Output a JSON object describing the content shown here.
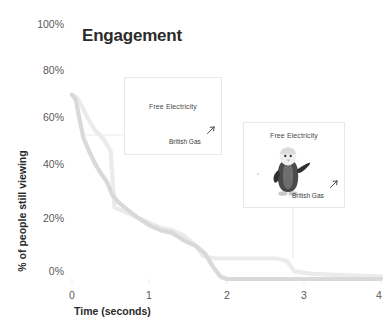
{
  "chart_data": {
    "type": "line",
    "title": "Engagement",
    "xlabel": "Time (seconds)",
    "ylabel": "% of people still viewing",
    "xlim": [
      0,
      4
    ],
    "ylim": [
      0,
      100
    ],
    "xticks": [
      "0",
      "1",
      "2",
      "3",
      "4"
    ],
    "xtick_values": [
      0,
      1,
      2,
      3,
      4
    ],
    "yticks": [
      "0%",
      "20%",
      "40%",
      "60%",
      "80%",
      "100%"
    ],
    "ytick_values": [
      0,
      20,
      40,
      60,
      80,
      100
    ],
    "grid": false,
    "legend": "none",
    "series": [
      {
        "name": "Static creative",
        "color": "#d9d9d9",
        "points": [
          [
            0.0,
            72
          ],
          [
            0.05,
            70
          ],
          [
            0.1,
            62
          ],
          [
            0.15,
            55
          ],
          [
            0.22,
            50
          ],
          [
            0.3,
            45
          ],
          [
            0.38,
            41
          ],
          [
            0.45,
            38
          ],
          [
            0.52,
            33
          ],
          [
            0.6,
            30
          ],
          [
            0.72,
            27
          ],
          [
            0.85,
            24
          ],
          [
            1.0,
            21
          ],
          [
            1.15,
            19
          ],
          [
            1.3,
            18
          ],
          [
            1.45,
            15
          ],
          [
            1.6,
            13
          ],
          [
            1.72,
            10
          ],
          [
            1.82,
            5
          ],
          [
            1.92,
            1
          ],
          [
            2.0,
            0
          ],
          [
            2.5,
            0
          ],
          [
            3.0,
            0
          ],
          [
            3.5,
            0
          ],
          [
            4.0,
            0
          ]
        ]
      },
      {
        "name": "Penguin creative",
        "color": "#ebebeb",
        "points": [
          [
            0.0,
            72
          ],
          [
            0.06,
            71
          ],
          [
            0.12,
            68
          ],
          [
            0.2,
            63
          ],
          [
            0.3,
            58
          ],
          [
            0.4,
            55
          ],
          [
            0.5,
            50
          ],
          [
            0.55,
            28
          ],
          [
            0.7,
            26
          ],
          [
            0.85,
            24
          ],
          [
            1.0,
            22
          ],
          [
            1.15,
            20
          ],
          [
            1.3,
            19
          ],
          [
            1.45,
            17
          ],
          [
            1.6,
            13
          ],
          [
            1.7,
            9
          ],
          [
            1.85,
            8
          ],
          [
            2.1,
            8
          ],
          [
            2.4,
            8
          ],
          [
            2.65,
            8
          ],
          [
            2.78,
            7
          ],
          [
            2.88,
            3
          ],
          [
            3.1,
            2
          ],
          [
            3.5,
            1.5
          ],
          [
            4.0,
            1
          ]
        ]
      }
    ],
    "annotations": [
      {
        "id": "creative-card-1",
        "headline": "Free Electricity",
        "brand": "British Gas",
        "has_mascot": false,
        "leader": "horizontal-left"
      },
      {
        "id": "creative-card-2",
        "headline": "Free Electricity",
        "brand": "British Gas",
        "has_mascot": true,
        "mascot": "penguin-mascot",
        "leader": "vertical-down"
      }
    ]
  }
}
